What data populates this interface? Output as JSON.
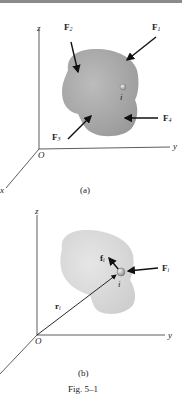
{
  "figure": {
    "caption": "Fig. 5–1",
    "panel_a": {
      "label": "(a)",
      "axes": {
        "z": "z",
        "y": "y",
        "x": "x",
        "origin": "O"
      },
      "forces": [
        {
          "name": "F",
          "sub": "1"
        },
        {
          "name": "F",
          "sub": "2"
        },
        {
          "name": "F",
          "sub": "3"
        },
        {
          "name": "F",
          "sub": "4"
        }
      ],
      "particle": "i"
    },
    "panel_b": {
      "label": "(b)",
      "axes": {
        "z": "z",
        "y": "y",
        "origin": "O"
      },
      "external_force": {
        "name": "F",
        "sub": "i"
      },
      "internal_force": {
        "name": "f",
        "sub": "i"
      },
      "position_vector": {
        "name": "r",
        "sub": "i"
      },
      "particle": "i"
    },
    "colors": {
      "body_a": "#a9a9a9",
      "body_b": "#d6d6d6",
      "axis": "#333333",
      "arrow": "#111111"
    }
  }
}
